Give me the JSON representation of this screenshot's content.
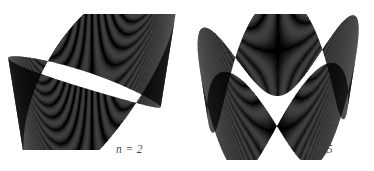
{
  "page": {
    "width": 374,
    "height": 171,
    "background": "#ffffff"
  },
  "figures": [
    {
      "id": "mobius-band-n2",
      "label": "n = 2",
      "label_x": 116,
      "label_y": 143,
      "box": {
        "x": 8,
        "y": 14,
        "width": 172,
        "height": 136
      },
      "twists": 2,
      "geometry": {
        "cx": 92,
        "cy": 82,
        "rx": 76,
        "ry": 42,
        "amplitude": 58,
        "tilt": -0.3,
        "phase": 0.62,
        "segments": 420
      },
      "shading": {
        "front_light": "#c9c9c9",
        "front_dark": "#4d4d4d",
        "back_light": "#9a9a9a",
        "back_dark": "#111111",
        "min_gray": "#101010",
        "max_gray": "#d2d2d2"
      }
    },
    {
      "id": "mobius-band-n5",
      "label": "n = 5",
      "label_x": 306,
      "label_y": 143,
      "box": {
        "x": 194,
        "y": 14,
        "width": 168,
        "height": 146
      },
      "twists": 5,
      "geometry": {
        "cx": 278,
        "cy": 86,
        "rx": 74,
        "ry": 40,
        "amplitude": 50,
        "tilt": -0.1,
        "phase": 0.3,
        "segments": 460
      },
      "shading": {
        "front_light": "#c9c9c9",
        "front_dark": "#4d4d4d",
        "back_light": "#9a9a9a",
        "back_dark": "#111111",
        "min_gray": "#101010",
        "max_gray": "#d2d2d2"
      }
    }
  ],
  "caption_style": {
    "color": "#4a4a4a",
    "font_size_px": 11.5,
    "italic": true
  }
}
